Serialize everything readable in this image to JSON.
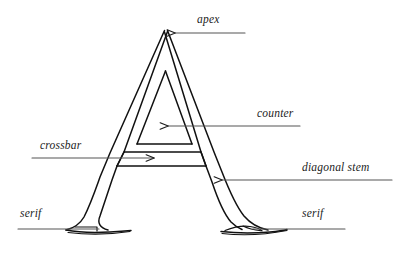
{
  "figure": {
    "style": "hand-drawn serif letterform outline",
    "background_color": "#ffffff",
    "ink_color": "#111111",
    "leader_line_color": "#555555",
    "label_text_color": "#1c1c1c"
  },
  "labels": {
    "apex": "apex",
    "counter": "counter",
    "crossbar": "crossbar",
    "diagonal_stem": "diagonal stem",
    "serif_left": "serif",
    "serif_right": "serif"
  },
  "annotations": [
    {
      "id": "apex",
      "text": "apex",
      "arrow_direction": "left",
      "points_to": "top point of the letter A"
    },
    {
      "id": "counter",
      "text": "counter",
      "arrow_direction": "left",
      "points_to": "enclosed triangular space inside the A"
    },
    {
      "id": "crossbar",
      "text": "crossbar",
      "arrow_direction": "right",
      "points_to": "horizontal bar joining the two stems"
    },
    {
      "id": "diagonal-stem",
      "text": "diagonal stem",
      "arrow_direction": "left",
      "points_to": "right diagonal stroke of the A"
    },
    {
      "id": "serif-left",
      "text": "serif",
      "arrow_direction": "none",
      "points_to": "flared foot at the base of the left stem"
    },
    {
      "id": "serif-right",
      "text": "serif",
      "arrow_direction": "none",
      "points_to": "flared foot at the base of the right stem"
    }
  ]
}
